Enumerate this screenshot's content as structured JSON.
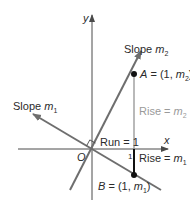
{
  "figure": {
    "type": "perpendicular-lines-slope-diagram",
    "colors": {
      "axis": "#4a4a4a",
      "line": "#6e6e6e",
      "rise_m2": "#9a9a9a",
      "rise_m1": "#111111",
      "point": "#111111",
      "text": "#2b2b2b",
      "text_muted": "#9a9a9a"
    }
  },
  "axes": {
    "x_label": "x",
    "y_label": "y",
    "origin_label": "O",
    "tick_label": "1"
  },
  "lines": [
    {
      "name": "line-m2",
      "label_prefix": "Slope ",
      "label_var": "m",
      "label_sub": "2"
    },
    {
      "name": "line-m1",
      "label_prefix": "Slope ",
      "label_var": "m",
      "label_sub": "1"
    }
  ],
  "points": {
    "A": {
      "name": "A",
      "eq": " = (1, ",
      "var": "m",
      "sub": "2",
      "close": ")"
    },
    "B": {
      "name": "B",
      "eq": " = (1, ",
      "var": "m",
      "sub": "1",
      "close": ")"
    }
  },
  "annotations": {
    "run": "Run = 1",
    "rise_m2_prefix": "Rise = ",
    "rise_m2_var": "m",
    "rise_m2_sub": "2",
    "rise_m1_prefix": "Rise = ",
    "rise_m1_var": "m",
    "rise_m1_sub": "1"
  }
}
